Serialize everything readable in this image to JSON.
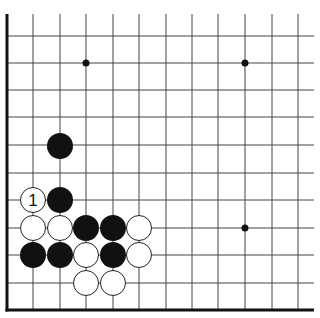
{
  "diagram": {
    "grid": {
      "x_lines": [
        33,
        60,
        86,
        113,
        139,
        166,
        192,
        218,
        245,
        272,
        298
      ],
      "y_lines": [
        36,
        63,
        90,
        117,
        145,
        173,
        200,
        228,
        255,
        283
      ],
      "left_edge_x": 7,
      "bottom_edge_y": 310,
      "top_y": 14,
      "right_x": 314,
      "line_color": "#444444",
      "edge_color": "#111111"
    },
    "star_points": [
      {
        "x": 86,
        "y": 63
      },
      {
        "x": 245,
        "y": 63
      },
      {
        "x": 245,
        "y": 228
      }
    ],
    "stones": [
      {
        "color": "black",
        "x": 60,
        "y": 146,
        "label": ""
      },
      {
        "color": "white",
        "x": 33,
        "y": 200,
        "label": "1"
      },
      {
        "color": "black",
        "x": 60,
        "y": 200,
        "label": ""
      },
      {
        "color": "white",
        "x": 33,
        "y": 228,
        "label": ""
      },
      {
        "color": "white",
        "x": 60,
        "y": 228,
        "label": ""
      },
      {
        "color": "black",
        "x": 86,
        "y": 228,
        "label": ""
      },
      {
        "color": "black",
        "x": 113,
        "y": 228,
        "label": ""
      },
      {
        "color": "white",
        "x": 139,
        "y": 228,
        "label": ""
      },
      {
        "color": "black",
        "x": 33,
        "y": 255,
        "label": ""
      },
      {
        "color": "black",
        "x": 60,
        "y": 255,
        "label": ""
      },
      {
        "color": "white",
        "x": 86,
        "y": 255,
        "label": ""
      },
      {
        "color": "black",
        "x": 113,
        "y": 255,
        "label": ""
      },
      {
        "color": "white",
        "x": 139,
        "y": 255,
        "label": ""
      },
      {
        "color": "white",
        "x": 86,
        "y": 283,
        "label": ""
      },
      {
        "color": "white",
        "x": 113,
        "y": 283,
        "label": ""
      }
    ],
    "stone_radius": 13
  }
}
